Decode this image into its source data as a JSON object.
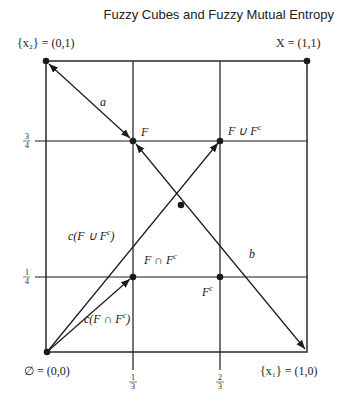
{
  "header": {
    "title": "Fuzzy Cubes and Fuzzy Mutual Entropy"
  },
  "diagram": {
    "corners": {
      "top_left": "{x₂} = (0,1)",
      "top_right": "X = (1,1)",
      "bottom_left": "∅ = (0,0)",
      "bottom_right": "{x₁} = (1,0)"
    },
    "points": {
      "F": "F",
      "F_union": "F ∪ F",
      "F_union_sup": "c",
      "F_intersect": "F ∩ F",
      "F_intersect_sup": "c",
      "F_complement": "F",
      "F_complement_sup": "c"
    },
    "edges": {
      "a": "a",
      "b": "b",
      "c_union": "c(F ∪ F",
      "c_union_sup": "c",
      "c_union_close": ")",
      "c_intersect": "c(F ∩ F",
      "c_intersect_sup": "c",
      "c_intersect_close": ")"
    },
    "ticks": {
      "x": [
        "1/3",
        "2/3"
      ],
      "y": [
        "1/4",
        "3/4"
      ],
      "x_one_third_num": "1",
      "x_one_third_den": "3",
      "x_two_third_num": "2",
      "x_two_third_den": "3",
      "y_one_quarter_num": "1",
      "y_one_quarter_den": "4",
      "y_three_quarter_num": "3",
      "y_three_quarter_den": "4"
    },
    "colors": {
      "line": "#1a1a1a",
      "background": "#ffffff"
    }
  }
}
